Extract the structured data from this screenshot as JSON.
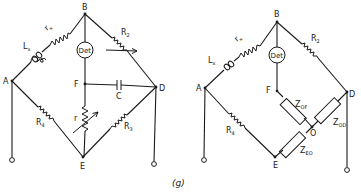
{
  "figure": {
    "caption": "(g)",
    "ink_color": "#1a1a1a",
    "background": "#ffffff"
  },
  "left_circuit": {
    "nodes": {
      "A": "A",
      "B": "B",
      "D": "D",
      "E": "E",
      "F": "F"
    },
    "detector": "Det",
    "components": {
      "Lx": {
        "main": "L",
        "sub": "x"
      },
      "rx": {
        "main": "r",
        "sub": "x"
      },
      "R2": {
        "main": "R",
        "sub": "2"
      },
      "R3": {
        "main": "R",
        "sub": "3"
      },
      "R4": {
        "main": "R",
        "sub": "4"
      },
      "r": {
        "main": "r"
      },
      "C": {
        "main": "C"
      }
    }
  },
  "right_circuit": {
    "nodes": {
      "A": "A",
      "B": "B",
      "D": "D",
      "E": "E",
      "F": "F",
      "O": "O"
    },
    "detector": "Det",
    "components": {
      "Lx": {
        "main": "L",
        "sub": "x"
      },
      "rx": {
        "main": "r",
        "sub": "x"
      },
      "R2": {
        "main": "R",
        "sub": "2"
      },
      "R4": {
        "main": "R",
        "sub": "4"
      },
      "ZOF": {
        "main": "Z",
        "sub": "OF"
      },
      "ZOD": {
        "main": "Z",
        "sub": "OD"
      },
      "ZEO": {
        "main": "Z",
        "sub": "EO"
      }
    }
  }
}
